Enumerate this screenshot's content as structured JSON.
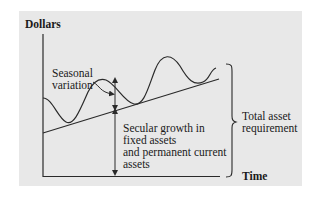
{
  "diagram": {
    "y_axis_label": "Dollars",
    "x_axis_label": "Time",
    "annotations": {
      "seasonal": [
        "Seasonal",
        "variation"
      ],
      "secular": [
        "Secular growth in",
        "fixed assets",
        "and permanent current",
        "assets"
      ],
      "total": [
        "Total asset",
        "requirement"
      ]
    },
    "colors": {
      "panel_background": "#e8e8e8",
      "line": "#2a2a2a",
      "text": "#1a1a1a"
    }
  }
}
